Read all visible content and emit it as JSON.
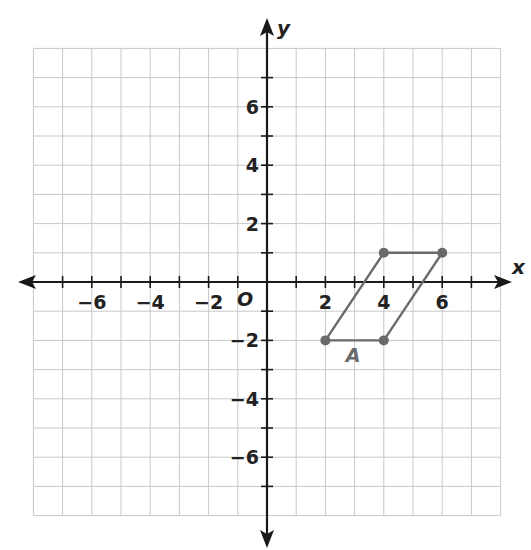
{
  "graph": {
    "x_axis_label": "x",
    "y_axis_label": "y",
    "origin_label": "O",
    "range": {
      "xmin": -8,
      "xmax": 8,
      "ymin": -8,
      "ymax": 8
    },
    "x_tick_labels": [
      "−6",
      "−4",
      "−2",
      "2",
      "4",
      "6"
    ],
    "y_tick_labels": [
      "6",
      "4",
      "2",
      "−2",
      "−4",
      "−6"
    ],
    "figure": {
      "label": "A",
      "vertices": [
        [
          2,
          -2
        ],
        [
          4,
          1
        ],
        [
          6,
          1
        ],
        [
          4,
          -2
        ]
      ],
      "color": "#6a6a6a"
    },
    "colors": {
      "grid": "#c8c8c8",
      "axis": "#1a1a1a"
    }
  }
}
